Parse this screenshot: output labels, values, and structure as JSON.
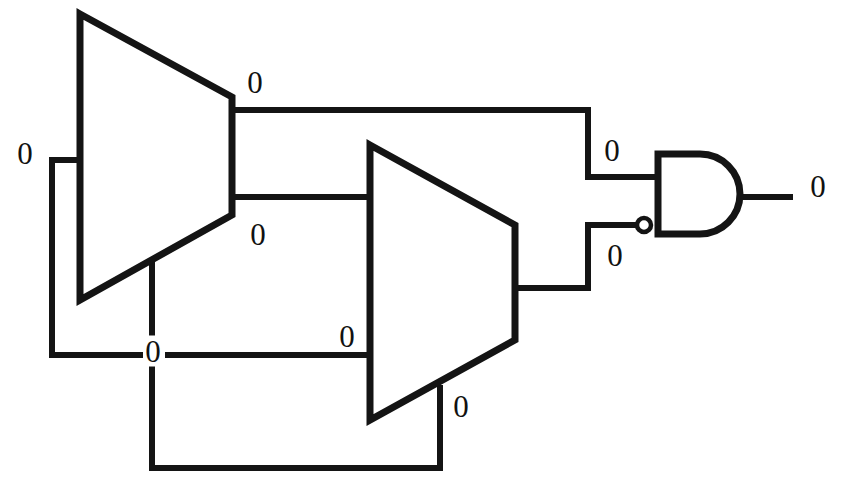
{
  "diagram": {
    "type": "logic-circuit-schematic",
    "background_color": "#ffffff",
    "line_color": "#141414",
    "width": 843,
    "height": 494
  },
  "components": [
    {
      "id": "mux1",
      "name": "multiplexer-1",
      "shape": "trapezoid",
      "left_x": 80,
      "left_top_y": 14,
      "left_bottom_y": 300,
      "right_x": 232,
      "right_top_y": 97,
      "right_bottom_y": 215
    },
    {
      "id": "mux2",
      "name": "multiplexer-2",
      "shape": "trapezoid",
      "left_x": 370,
      "left_top_y": 145,
      "left_bottom_y": 420,
      "right_x": 515,
      "right_top_y": 225,
      "right_bottom_y": 340
    },
    {
      "id": "and1",
      "name": "and-gate",
      "shape": "and-gate",
      "left_x": 655,
      "top_y": 154,
      "bottom_y": 234,
      "right_x": 740,
      "inverted_inputs": [
        "lower"
      ]
    }
  ],
  "labels": [
    {
      "id": "lbl-input-left",
      "name": "signal-label-input-left",
      "value": "0",
      "x": 25,
      "y": 153
    },
    {
      "id": "lbl-mux1-out-top",
      "name": "signal-label-mux1-output-top",
      "value": "0",
      "x": 255,
      "y": 82
    },
    {
      "id": "lbl-mux1-out-bot",
      "name": "signal-label-mux1-output-bottom",
      "value": "0",
      "x": 258,
      "y": 234
    },
    {
      "id": "lbl-mux1-select",
      "name": "signal-label-mux1-select",
      "value": "0",
      "x": 153,
      "y": 351
    },
    {
      "id": "lbl-mux2-in-bot",
      "name": "signal-label-mux2-input-bottom",
      "value": "0",
      "x": 347,
      "y": 336
    },
    {
      "id": "lbl-mux2-select",
      "name": "signal-label-mux2-select",
      "value": "0",
      "x": 461,
      "y": 406
    },
    {
      "id": "lbl-and-in-top",
      "name": "signal-label-and-input-top",
      "value": "0",
      "x": 612,
      "y": 150
    },
    {
      "id": "lbl-and-in-bot",
      "name": "signal-label-and-input-bottom",
      "value": "0",
      "x": 615,
      "y": 255
    },
    {
      "id": "lbl-and-out",
      "name": "signal-label-and-output",
      "value": "0",
      "x": 818,
      "y": 186
    }
  ],
  "wires": [
    {
      "id": "w-left-stub",
      "name": "wire-left-input-stub",
      "path": "M 52 160 L 80 160"
    },
    {
      "id": "w-left-down",
      "name": "wire-left-feedback-down",
      "path": "M 52 160 L 52 355 L 140 355"
    },
    {
      "id": "w-mux1-out-top",
      "name": "wire-mux1-output-top",
      "path": "M 232 110 L 588 110 L 588 177 L 655 177"
    },
    {
      "id": "w-mux1-out-bot",
      "name": "wire-mux1-output-bottom",
      "path": "M 232 197 L 370 197"
    },
    {
      "id": "w-mux1-select",
      "name": "wire-mux1-select-vertical",
      "path": "M 152 265 L 152 468"
    },
    {
      "id": "w-mid-horiz",
      "name": "wire-mid-horizontal-to-mux2",
      "path": "M 165 355 L 370 355"
    },
    {
      "id": "w-bottom-feedback",
      "name": "wire-bottom-feedback",
      "path": "M 152 468 L 440 468 L 440 385"
    },
    {
      "id": "w-mux2-out",
      "name": "wire-mux2-output",
      "path": "M 515 288 L 588 288 L 588 225 L 640 225"
    },
    {
      "id": "w-and-out",
      "name": "wire-and-gate-output",
      "path": "M 740 197 L 790 197"
    }
  ]
}
